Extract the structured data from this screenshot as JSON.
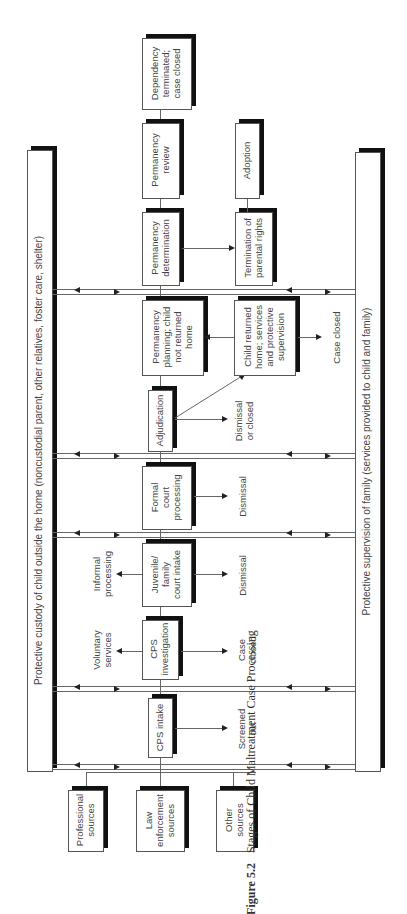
{
  "figure": {
    "number": "Figure 5.2",
    "title": "Stages of Child Maltreatment Case Processing"
  },
  "banners": {
    "custody": "Protective custody of child outside the home (noncustodial parent, other relatives, foster care, shelter)",
    "supervision": "Protective supervision of family (services provided to child and family)"
  },
  "sources": {
    "professional": "Professional\nsources",
    "law": "Law\nenforcement\nsources",
    "other": "Other\nsources"
  },
  "stages": {
    "cps_intake": "CPS intake",
    "cps_investigation": "CPS\ninvestigation",
    "juvenile_intake": "Juvenile/\nfamily\ncourt intake",
    "formal_court": "Formal\ncourt\nprocessing",
    "adjudication": "Adjudication",
    "permanency_planning": "Permanency\nplanning; child\nnot returned\nhome",
    "child_returned": "Child returned\nhome; services\nand protective\nsupervision",
    "permanency_determination": "Permanency\ndetermination",
    "termination": "Termination of\nparental rights",
    "permanency_review": "Permanency\nreview",
    "adoption": "Adoption",
    "dependency_terminated": "Dependency\nterminated;\ncase closed"
  },
  "outcomes": {
    "screened_out": "Screened\nout",
    "voluntary_services": "Voluntary\nservices",
    "case_closed_cps": "Case\nclosed",
    "informal_processing": "Informal\nprocessing",
    "dismissal_juvenile": "Dismissal",
    "dismissal_formal": "Dismissal",
    "dismissal_or_closed": "Dismissal\nor closed",
    "case_closed_final": "Case closed"
  }
}
